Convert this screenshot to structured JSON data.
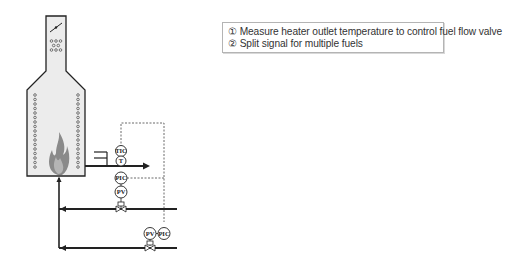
{
  "notes": {
    "lines": [
      "① Measure heater outlet temperature to control fuel flow valve",
      "② Split signal for multiple fuels"
    ]
  },
  "instruments": {
    "tic_top": "TIC",
    "te": "T",
    "pic_1": "PIC",
    "pv_1": "PV",
    "pv_2": "PV",
    "pic_2": "PIC"
  },
  "colors": {
    "furnace_fill": "#ececec",
    "line": "#222222",
    "flame": "#888888",
    "note_border": "#b4b4b4"
  }
}
